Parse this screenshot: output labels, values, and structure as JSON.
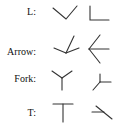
{
  "rows": [
    {
      "label": "L:",
      "shapes": [
        "v-shape-junction",
        "right-angle-junction"
      ]
    },
    {
      "label": "Arrow:",
      "shapes": [
        "arrow-junction-up",
        "arrow-junction-left"
      ]
    },
    {
      "label": "Fork:",
      "shapes": [
        "fork-junction-upright",
        "fork-junction-rotated"
      ]
    },
    {
      "label": "T:",
      "shapes": [
        "t-junction-upright",
        "t-junction-rotated"
      ]
    }
  ],
  "stroke_color": "#333333"
}
